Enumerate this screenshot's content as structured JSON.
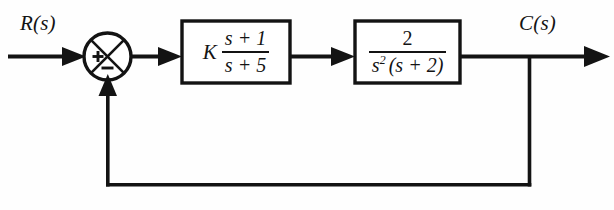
{
  "diagram": {
    "type": "control-system-block-diagram",
    "background_color": "#fefefe",
    "line_color": "#131313",
    "input_label": "R(s)",
    "output_label": "C(s)",
    "summing_junction": {
      "name": "summing-junction",
      "input_sign": "+",
      "feedback_sign": "−",
      "style": "circle-with-x-cross"
    },
    "blocks": [
      {
        "name": "controller-block",
        "gain": "K",
        "numerator": "s + 1",
        "denominator": "s + 5",
        "expression": "K (s+1)/(s+5)"
      },
      {
        "name": "plant-block",
        "gain": "",
        "numerator": "2",
        "denominator_base": "s",
        "denominator_exponent": "2",
        "denominator_factor": "(s + 2)",
        "expression": "2 / (s^2 (s+2))"
      }
    ],
    "feedback": {
      "name": "feedback-path",
      "gain": "1",
      "type": "unity"
    }
  }
}
